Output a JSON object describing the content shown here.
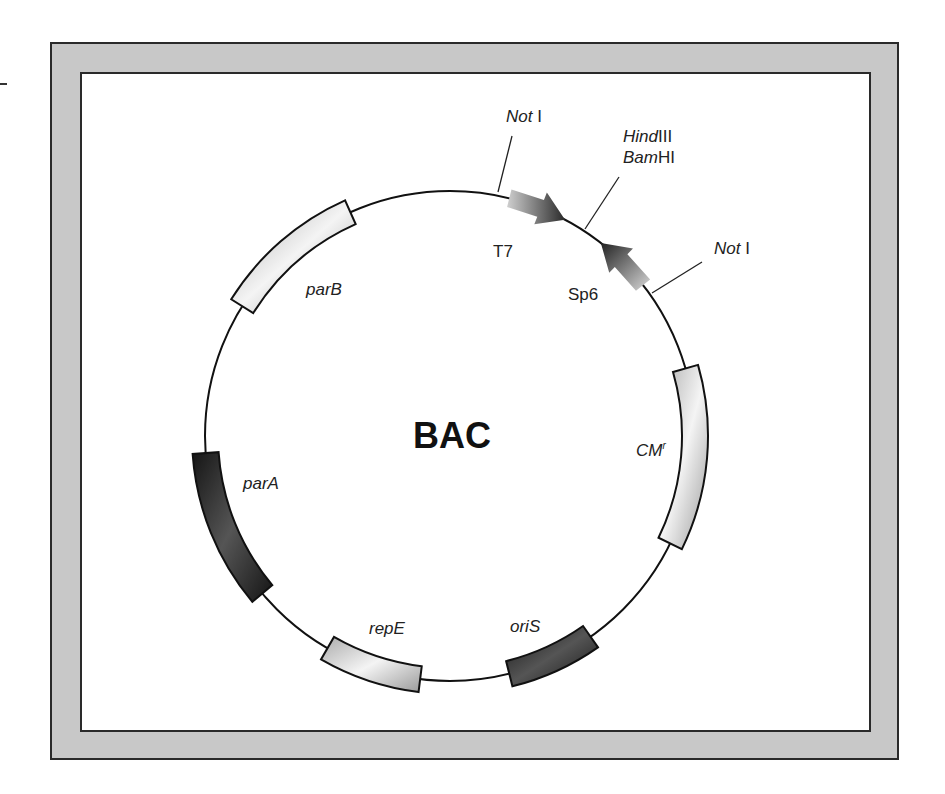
{
  "diagram": {
    "title": "BAC",
    "type": "plasmid-map",
    "colors": {
      "frame": "#c8c8c8",
      "border": "#2a2a2a",
      "light_segment": "#d6d6d6",
      "dark_segment": "#2b2b2b",
      "background": "#ffffff"
    },
    "segments": [
      {
        "name": "parB",
        "italic": true,
        "start_deg": 302,
        "end_deg": 336,
        "shade": "light"
      },
      {
        "name": "parA",
        "italic": true,
        "start_deg": 230,
        "end_deg": 266,
        "shade": "dark"
      },
      {
        "name": "repE",
        "italic": true,
        "start_deg": 187,
        "end_deg": 210,
        "shade": "light"
      },
      {
        "name": "oriS",
        "italic": true,
        "start_deg": 145,
        "end_deg": 166,
        "shade": "dark"
      },
      {
        "name": "CM",
        "superscript": "r",
        "italic": true,
        "start_deg": 74,
        "end_deg": 116,
        "shade": "light"
      }
    ],
    "promoters": [
      {
        "name": "T7",
        "direction": "clockwise",
        "start_deg": 14,
        "end_deg": 28
      },
      {
        "name": "Sp6",
        "direction": "counterclockwise",
        "start_deg": 38,
        "end_deg": 52
      }
    ],
    "sites": [
      {
        "italic_part": "Not",
        "plain_part": " I",
        "angle_deg": 11
      },
      {
        "lines": [
          {
            "italic_part": "Hind",
            "plain_part": "III"
          },
          {
            "italic_part": "Bam",
            "plain_part": "HI"
          }
        ],
        "angle_deg": 33
      },
      {
        "italic_part": "Not",
        "plain_part": " I",
        "angle_deg": 55
      }
    ]
  },
  "labels": {
    "title": "BAC",
    "parB": "parB",
    "parA": "parA",
    "repE": "repE",
    "oriS": "oriS",
    "cm": "CM",
    "cm_sup": "r",
    "t7": "T7",
    "sp6": "Sp6",
    "not1_top_italic": "Not",
    "not1_top_plain": " I",
    "hind_italic": "Hind",
    "hind_plain": "III",
    "bam_italic": "Bam",
    "bam_plain": "HI",
    "not1_right_italic": "Not",
    "not1_right_plain": " I"
  }
}
